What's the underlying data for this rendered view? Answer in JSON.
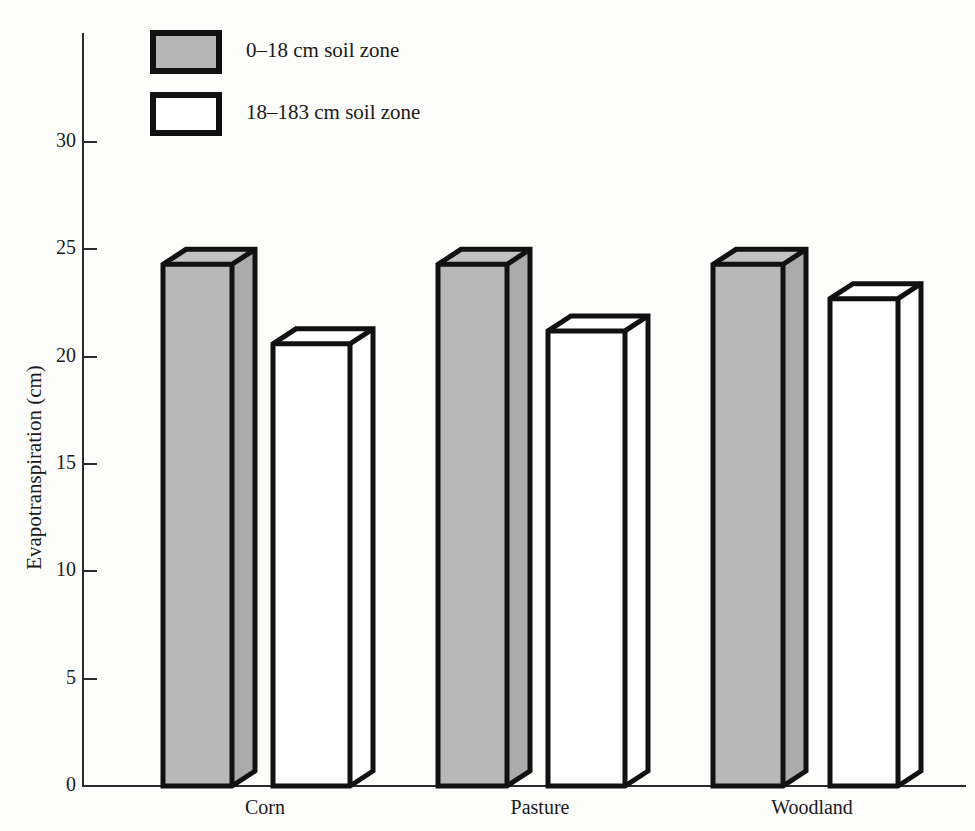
{
  "chart_data": {
    "type": "bar",
    "title": "",
    "subtitle": "",
    "xlabel": "",
    "ylabel": "Evapotranspiration (cm)",
    "categories": [
      "Corn",
      "Pasture",
      "Woodland"
    ],
    "series": [
      {
        "name": "0–18 cm soil zone",
        "values": [
          24.3,
          24.3,
          24.3
        ],
        "fill": "#b8b8b8"
      },
      {
        "name": "18–183 cm soil zone",
        "values": [
          20.6,
          21.2,
          22.7
        ],
        "fill": "#ffffff"
      }
    ],
    "ylim": [
      0,
      30
    ],
    "yticks": [
      0,
      5,
      10,
      15,
      20,
      25,
      30
    ],
    "ytick_labels": [
      "0",
      "5",
      "10",
      "15",
      "20",
      "25",
      "30"
    ],
    "grid": false,
    "legend_position": "top-left",
    "style": "3d-isometric-bars",
    "annotations": []
  },
  "legend": {
    "items": [
      {
        "label": "0–18 cm soil zone",
        "swatch": "gray"
      },
      {
        "label": "18–183 cm soil zone",
        "swatch": "white"
      }
    ]
  },
  "axes": {
    "y_title": "Evapotranspiration (cm)",
    "y_ticks": [
      "0",
      "5",
      "10",
      "15",
      "20",
      "25",
      "30"
    ],
    "x_categories": [
      "Corn",
      "Pasture",
      "Woodland"
    ]
  },
  "colors": {
    "ink": "#111111",
    "axis": "#2b2b2b",
    "gray_fill": "#b8b8b8",
    "gray_side": "#ababab",
    "gray_top": "#c2c2c2",
    "white_fill": "#ffffff",
    "background": "#fdfdfb"
  }
}
